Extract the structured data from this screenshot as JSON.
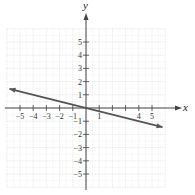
{
  "chart_data": {
    "type": "line",
    "title": "",
    "xlabel": "x",
    "ylabel": "y",
    "xlim": [
      -6,
      6
    ],
    "ylim": [
      -6,
      6
    ],
    "grid": true,
    "x_ticks": [
      -5,
      -4,
      -3,
      -2,
      -1,
      1,
      4,
      5
    ],
    "y_ticks": [
      -5,
      -4,
      -3,
      -2,
      -1,
      1,
      2,
      3,
      4,
      5
    ],
    "series": [
      {
        "name": "y = -x/4",
        "equation": "y = -1/4 x",
        "x": [
          -5.8,
          5.8
        ],
        "y": [
          1.45,
          -1.45
        ],
        "arrows_both_ends": true
      }
    ],
    "colors": {
      "line": "#555555",
      "axis": "#444444",
      "grid": "#e4e4e4"
    }
  },
  "labels": {
    "x_axis": "x",
    "y_axis": "y"
  }
}
